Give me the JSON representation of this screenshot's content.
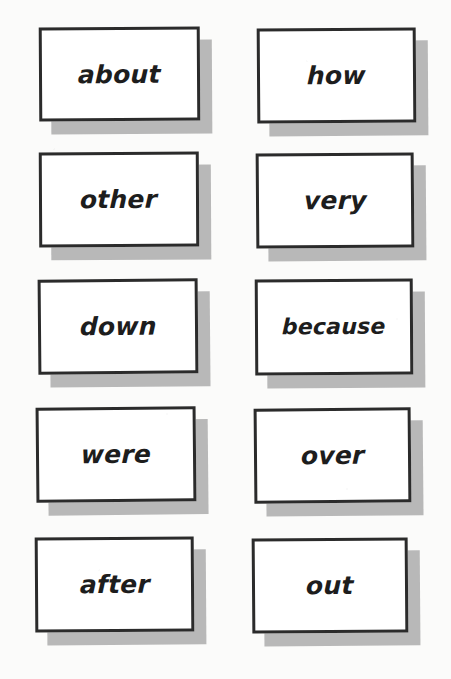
{
  "document": {
    "kind": "sight-word-flashcard-sheet",
    "columns": 2,
    "rows": 5
  },
  "theme": {
    "page_background": "#fbfbfa",
    "card_background": "#ffffff",
    "card_border": "#2b2b2b",
    "card_shadow": "#b8b8b8",
    "text_color": "#1d1d1d"
  },
  "cards": [
    {
      "word": "about",
      "row": 1,
      "column": 1
    },
    {
      "word": "how",
      "row": 1,
      "column": 2
    },
    {
      "word": "other",
      "row": 2,
      "column": 1
    },
    {
      "word": "very",
      "row": 2,
      "column": 2
    },
    {
      "word": "down",
      "row": 3,
      "column": 1
    },
    {
      "word": "because",
      "row": 3,
      "column": 2
    },
    {
      "word": "were",
      "row": 4,
      "column": 1
    },
    {
      "word": "over",
      "row": 4,
      "column": 2
    },
    {
      "word": "after",
      "row": 5,
      "column": 1
    },
    {
      "word": "out",
      "row": 5,
      "column": 2
    }
  ]
}
